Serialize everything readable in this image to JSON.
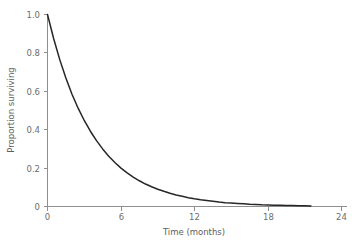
{
  "chart_data": {
    "type": "line",
    "title": "",
    "subtitle": "",
    "xlabel": "Time (months)",
    "ylabel": "Proportion surviving",
    "xlim": [
      0,
      24
    ],
    "ylim": [
      0,
      1.0
    ],
    "xticks": [
      0,
      6,
      12,
      18,
      24
    ],
    "xticklabels": [
      "0",
      "6",
      "12",
      "18",
      "24"
    ],
    "yticks": [
      0,
      0.2,
      0.4,
      0.6,
      0.8,
      1.0
    ],
    "yticklabels": [
      "0",
      "0.2",
      "0.4",
      "0.6",
      "0.8",
      "1.0"
    ],
    "grid": false,
    "legend": null,
    "annotations": [],
    "series": [
      {
        "name": "Exponential survival curve",
        "description": "S(t) = exp(-0.268 t)",
        "color": "#262626",
        "x": [
          0,
          0.5,
          1,
          1.5,
          2,
          2.5,
          3,
          3.5,
          4,
          4.5,
          5,
          5.5,
          6,
          6.5,
          7,
          7.5,
          8,
          8.5,
          9,
          9.5,
          10,
          10.5,
          11,
          11.5,
          12,
          12.5,
          13,
          13.5,
          14,
          14.5,
          15,
          15.5,
          16,
          16.5,
          17,
          17.5,
          18,
          18.5,
          19,
          19.5,
          20,
          20.5,
          21,
          21.5
        ],
        "y": [
          1.0,
          0.875,
          0.765,
          0.669,
          0.585,
          0.512,
          0.448,
          0.392,
          0.343,
          0.3,
          0.262,
          0.229,
          0.2,
          0.175,
          0.153,
          0.134,
          0.117,
          0.103,
          0.09,
          0.079,
          0.069,
          0.06,
          0.053,
          0.046,
          0.04,
          0.035,
          0.031,
          0.027,
          0.023,
          0.02,
          0.018,
          0.016,
          0.014,
          0.012,
          0.011,
          0.009,
          0.008,
          0.007,
          0.006,
          0.005,
          0.005,
          0.004,
          0.004,
          0.003
        ]
      }
    ]
  },
  "axes": {
    "y_axis_label": "Proportion surviving",
    "x_axis_label": "Time (months)",
    "y_tick_labels": [
      "1.0",
      "0.8",
      "0.6",
      "0.4",
      "0.2",
      "0"
    ],
    "x_tick_labels": [
      "0",
      "6",
      "12",
      "18",
      "24"
    ]
  },
  "colors": {
    "curve": "#262626",
    "axis": "#8e8e8e",
    "tick_text": "#6d6d6d",
    "axis_title": "#5e5e5e",
    "background": "#ffffff"
  }
}
